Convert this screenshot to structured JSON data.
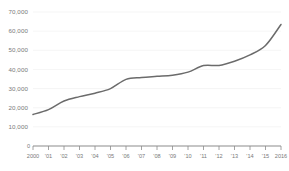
{
  "chart_data": {
    "type": "line",
    "title": "",
    "subtitle": "",
    "xlabel": "",
    "ylabel": "",
    "grid": true,
    "legend": false,
    "legend_position": "none",
    "line_color": "#6b6b6b",
    "axis_color": "#8c8c8c",
    "grid_color": "#f2f2f2",
    "x": [
      2000,
      2001,
      2002,
      2003,
      2004,
      2005,
      2006,
      2007,
      2008,
      2009,
      2010,
      2011,
      2012,
      2013,
      2014,
      2015,
      2016
    ],
    "categories": [
      "2000",
      "'01",
      "'02",
      "'03",
      "'04",
      "'05",
      "'06",
      "'07",
      "'08",
      "'09",
      "'10",
      "'11",
      "'12",
      "'13",
      "'14",
      "'15",
      "2016"
    ],
    "values": [
      16500,
      19000,
      23500,
      25800,
      27600,
      30000,
      34800,
      35800,
      36400,
      37000,
      38600,
      42000,
      42100,
      44300,
      47600,
      52500,
      63500
    ],
    "xlim": [
      2000,
      2016
    ],
    "ylim": [
      0,
      70000
    ],
    "ytick_values": [
      0,
      10000,
      20000,
      30000,
      40000,
      50000,
      60000,
      70000
    ],
    "ytick_labels": [
      "0",
      "10,000",
      "20,000",
      "30,000",
      "40,000",
      "50,000",
      "60,000",
      "70,000"
    ],
    "xtick_labels": [
      "2000",
      "'01",
      "'02",
      "'03",
      "'04",
      "'05",
      "'06",
      "'07",
      "'08",
      "'09",
      "'10",
      "'11",
      "'12",
      "'13",
      "'14",
      "'15",
      "2016"
    ]
  }
}
